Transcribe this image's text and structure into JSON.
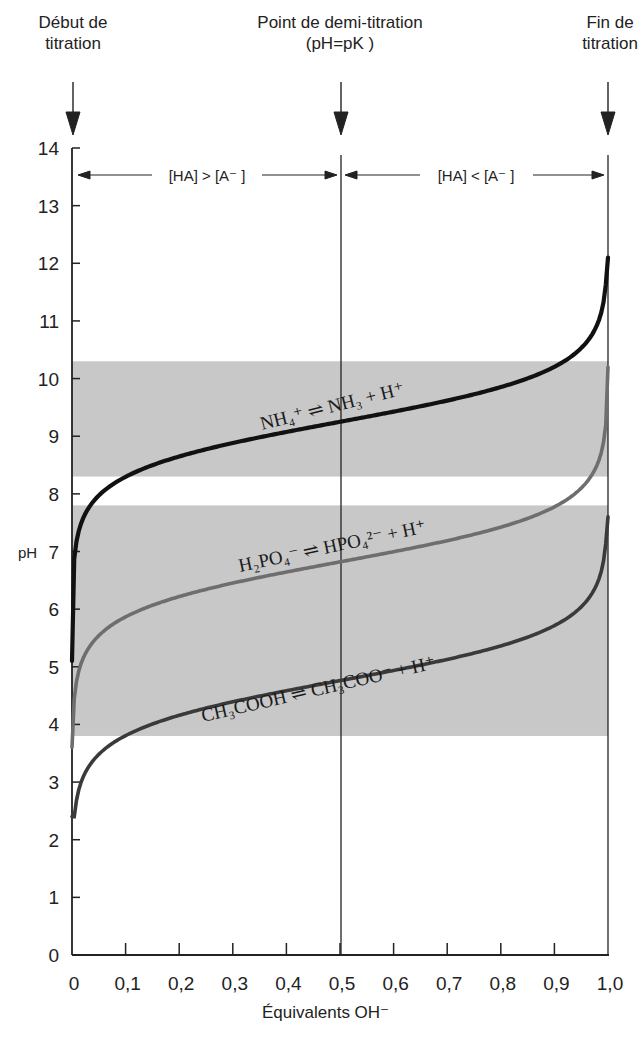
{
  "top_labels": {
    "start": {
      "line1": "Début de",
      "line2": "titration"
    },
    "half": {
      "line1": "Point de demi-titration",
      "line2": "(pH=pK )"
    },
    "end": {
      "line1": "Fin de",
      "line2": "titration"
    }
  },
  "regions": {
    "left": "[HA] > [A⁻ ]",
    "right": "[HA] < [A⁻ ]"
  },
  "axes": {
    "xlabel": "Équivalents OH⁻",
    "ylabel": "pH",
    "x_ticks": [
      "0",
      "0,1",
      "0,2",
      "0,3",
      "0,4",
      "0,5",
      "0,6",
      "0,7",
      "0,8",
      "0,9",
      "1,0"
    ],
    "y_ticks": [
      "0",
      "1",
      "2",
      "3",
      "4",
      "5",
      "6",
      "7",
      "8",
      "9",
      "10",
      "11",
      "12",
      "13",
      "14"
    ]
  },
  "equations": {
    "nh4": "NH₄⁺ ⇌ NH₃ + H⁺",
    "h2po4": "H₂PO₄⁻ ⇌ HPO₄²⁻ + H⁺",
    "ch3cooh": "CH₃COOH ⇌ CH₃COO⁻ + H⁺"
  },
  "colors": {
    "band": "#c8c8c8",
    "nh4_curve": "#111111",
    "h2po4_curve": "#6e6e6e",
    "ch3cooh_curve": "#3a3a3a",
    "axis": "#222222"
  },
  "chart_data": {
    "type": "line",
    "title": "",
    "xlabel": "Équivalents OH⁻",
    "ylabel": "pH",
    "xlim": [
      0,
      1.0
    ],
    "ylim": [
      0,
      14
    ],
    "grid": false,
    "x_tick_labels": [
      "0",
      "0,1",
      "0,2",
      "0,3",
      "0,4",
      "0,5",
      "0,6",
      "0,7",
      "0,8",
      "0,9",
      "1,0"
    ],
    "y_tick_labels": [
      "0",
      "1",
      "2",
      "3",
      "4",
      "5",
      "6",
      "7",
      "8",
      "9",
      "10",
      "11",
      "12",
      "13",
      "14"
    ],
    "annotations": [
      {
        "text": "Début de titration",
        "x": 0
      },
      {
        "text": "Point de demi-titration (pH=pK)",
        "x": 0.5
      },
      {
        "text": "Fin de titration",
        "x": 1.0
      },
      {
        "text": "[HA] > [A⁻]",
        "x_range": [
          0,
          0.5
        ],
        "y": 13.5
      },
      {
        "text": "[HA] < [A⁻]",
        "x_range": [
          0.5,
          1.0
        ],
        "y": 13.5
      }
    ],
    "shaded_bands": [
      {
        "name": "NH4+ buffer range",
        "y_range": [
          8.3,
          10.3
        ]
      },
      {
        "name": "H2PO4- / CH3COOH buffer range",
        "y_range": [
          3.8,
          7.8
        ]
      }
    ],
    "x": [
      0.0,
      0.01,
      0.05,
      0.1,
      0.2,
      0.3,
      0.4,
      0.5,
      0.6,
      0.7,
      0.8,
      0.9,
      0.95,
      0.99,
      1.0
    ],
    "series": [
      {
        "name": "NH4+ ⇌ NH3 + H+",
        "pK": 9.25,
        "values": [
          5.1,
          7.4,
          8.0,
          8.3,
          8.65,
          8.9,
          9.1,
          9.25,
          9.4,
          9.6,
          9.85,
          10.2,
          10.5,
          11.2,
          12.1
        ]
      },
      {
        "name": "H2PO4- ⇌ HPO4^2- + H+",
        "pK": 6.82,
        "values": [
          3.6,
          5.0,
          5.6,
          5.9,
          6.2,
          6.45,
          6.65,
          6.82,
          7.0,
          7.2,
          7.42,
          7.8,
          8.1,
          8.9,
          10.2
        ]
      },
      {
        "name": "CH3COOH ⇌ CH3COO- + H+",
        "pK": 4.76,
        "values": [
          2.4,
          2.9,
          3.5,
          3.8,
          4.15,
          4.4,
          4.6,
          4.76,
          4.93,
          5.13,
          5.36,
          5.7,
          6.0,
          6.8,
          7.6
        ]
      }
    ],
    "reference_lines": [
      {
        "x": 0.5
      },
      {
        "x": 1.0
      }
    ]
  }
}
